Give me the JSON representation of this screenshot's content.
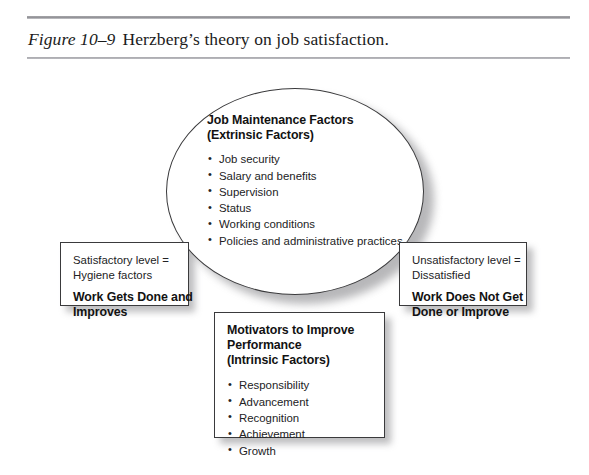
{
  "figure": {
    "label": "Figure 10–9",
    "title": "Herzberg’s theory on job satisfaction."
  },
  "colors": {
    "background": "#ffffff",
    "stroke": "#3a3a3c",
    "text": "#1a1a1a",
    "rule": "#8f8f94",
    "shadow": "#7d7d81"
  },
  "ellipse": {
    "heading_line1": "Job Maintenance Factors",
    "heading_line2": "(Extrinsic Factors)",
    "bullets": [
      "Job security",
      "Salary and benefits",
      "Supervision",
      "Status",
      "Working conditions",
      "Policies and administrative practices"
    ]
  },
  "left_box": {
    "line1": "Satisfactory level =",
    "line2": "Hygiene factors",
    "emphasis_line1": "Work Gets Done and",
    "emphasis_line2": "Improves"
  },
  "right_box": {
    "line1": "Unsatisfactory level =",
    "line2": "Dissatisfied",
    "emphasis_line1": "Work Does Not Get",
    "emphasis_line2": "Done or Improve"
  },
  "bottom_box": {
    "heading_line1": "Motivators to Improve",
    "heading_line2": "Performance",
    "heading_line3": "(Intrinsic Factors)",
    "bullets": [
      "Responsibility",
      "Advancement",
      "Recognition",
      "Achievement",
      "Growth"
    ]
  }
}
